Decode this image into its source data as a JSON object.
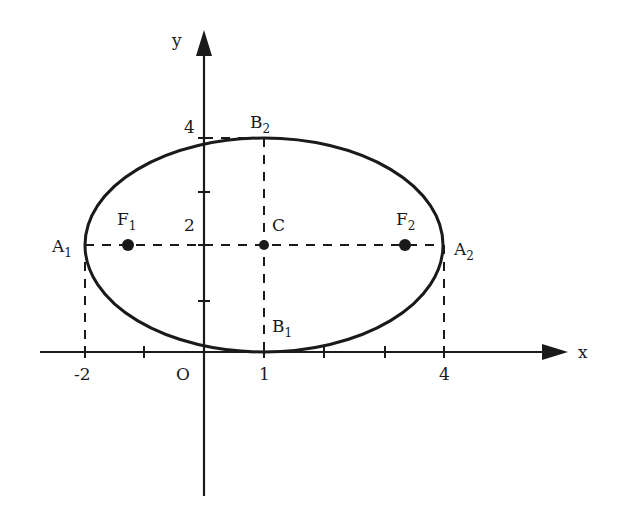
{
  "diagram": {
    "type": "ellipse-on-coordinate-plane",
    "axes": {
      "x_label": "x",
      "y_label": "y",
      "origin_label": "O",
      "x_ticks": [
        {
          "value": -2,
          "label": "-2"
        },
        {
          "value": 1,
          "label": "1"
        },
        {
          "value": 4,
          "label": "4"
        }
      ],
      "y_ticks": [
        {
          "value": 2,
          "label": "2"
        },
        {
          "value": 4,
          "label": "4"
        }
      ]
    },
    "ellipse": {
      "center": {
        "name": "C",
        "x": 1,
        "y": 2
      },
      "semi_major": 3,
      "semi_minor": 2
    },
    "points": {
      "A1": {
        "base": "A",
        "sub": "1",
        "x": -2,
        "y": 2
      },
      "A2": {
        "base": "A",
        "sub": "2",
        "x": 4,
        "y": 2
      },
      "B1": {
        "base": "B",
        "sub": "1",
        "x": 1,
        "y": 0
      },
      "B2": {
        "base": "B",
        "sub": "2",
        "x": 1,
        "y": 4
      },
      "F1": {
        "base": "F",
        "sub": "1"
      },
      "F2": {
        "base": "F",
        "sub": "2"
      },
      "C": {
        "label": "C",
        "x": 1,
        "y": 2
      }
    },
    "colors": {
      "stroke": "#1a1a1a",
      "background": "#ffffff"
    }
  }
}
